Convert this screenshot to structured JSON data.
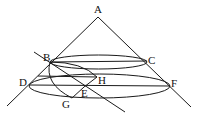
{
  "diagram": {
    "type": "geometry-cone-section",
    "stroke_color": "#1a1a1a",
    "background": "#ffffff",
    "points": {
      "A": {
        "label": "A",
        "x": 98,
        "y": 17,
        "lx": 94,
        "ly": 13
      },
      "B": {
        "label": "B",
        "x": 50,
        "y": 62,
        "lx": 42,
        "ly": 61
      },
      "C": {
        "label": "C",
        "x": 147,
        "y": 61,
        "lx": 148,
        "ly": 64
      },
      "D": {
        "label": "D",
        "x": 29,
        "y": 85,
        "lx": 19,
        "ly": 85
      },
      "E": {
        "label": "E",
        "x": 84,
        "y": 87,
        "lx": 81,
        "ly": 97
      },
      "F": {
        "label": "F",
        "x": 170,
        "y": 86,
        "lx": 171,
        "ly": 86
      },
      "G": {
        "label": "G",
        "x": 72,
        "y": 98,
        "lx": 62,
        "ly": 107
      },
      "H": {
        "label": "H",
        "x": 97,
        "y": 77,
        "lx": 98,
        "ly": 84
      }
    },
    "labels": [
      "A",
      "B",
      "C",
      "D",
      "E",
      "F",
      "G",
      "H"
    ]
  }
}
